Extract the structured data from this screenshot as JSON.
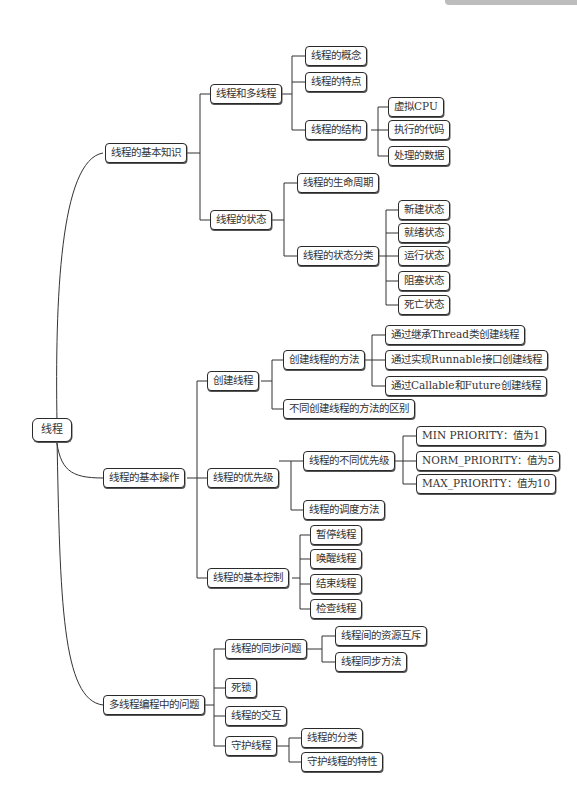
{
  "header": {
    "decoration": "gray tab (cropped page header)"
  },
  "mindmap": {
    "root": "线程",
    "branches": [
      {
        "label": "线程的基本知识",
        "children": [
          {
            "label": "线程和多线程",
            "children": [
              {
                "label": "线程的概念"
              },
              {
                "label": "线程的特点"
              },
              {
                "label": "线程的结构",
                "children": [
                  {
                    "label": "虚拟CPU"
                  },
                  {
                    "label": "执行的代码"
                  },
                  {
                    "label": "处理的数据"
                  }
                ]
              }
            ]
          },
          {
            "label": "线程的状态",
            "children": [
              {
                "label": "线程的生命周期"
              },
              {
                "label": "线程的状态分类",
                "children": [
                  {
                    "label": "新建状态"
                  },
                  {
                    "label": "就绪状态"
                  },
                  {
                    "label": "运行状态"
                  },
                  {
                    "label": "阻塞状态"
                  },
                  {
                    "label": "死亡状态"
                  }
                ]
              }
            ]
          }
        ]
      },
      {
        "label": "线程的基本操作",
        "children": [
          {
            "label": "创建线程",
            "children": [
              {
                "label": "创建线程的方法",
                "children": [
                  {
                    "label": "通过继承Thread类创建线程"
                  },
                  {
                    "label": "通过实现Runnable接口创建线程"
                  },
                  {
                    "label": "通过Callable和Future创建线程"
                  }
                ]
              },
              {
                "label": "不同创建线程的方法的区别"
              }
            ]
          },
          {
            "label": "线程的优先级",
            "children": [
              {
                "label": "线程的不同优先级",
                "children": [
                  {
                    "label": "MIN PRIORITY：值为1"
                  },
                  {
                    "label": "NORM_PRIORITY：值为5"
                  },
                  {
                    "label": "MAX_PRIORITY：值为10"
                  }
                ]
              },
              {
                "label": "线程的调度方法"
              }
            ]
          },
          {
            "label": "线程的基本控制",
            "children": [
              {
                "label": "暂停线程"
              },
              {
                "label": "唤醒线程"
              },
              {
                "label": "结束线程"
              },
              {
                "label": "检查线程"
              }
            ]
          }
        ]
      },
      {
        "label": "多线程编程中的问题",
        "children": [
          {
            "label": "线程的同步问题",
            "children": [
              {
                "label": "线程间的资源互斥"
              },
              {
                "label": "线程同步方法"
              }
            ]
          },
          {
            "label": "死锁"
          },
          {
            "label": "线程的交互"
          },
          {
            "label": "守护线程",
            "children": [
              {
                "label": "线程的分类"
              },
              {
                "label": "守护线程的特性"
              }
            ]
          }
        ]
      }
    ]
  },
  "colors": {
    "line": "#333333",
    "border": "#2a2a2a",
    "text": "#333333",
    "background": "#ffffff"
  }
}
